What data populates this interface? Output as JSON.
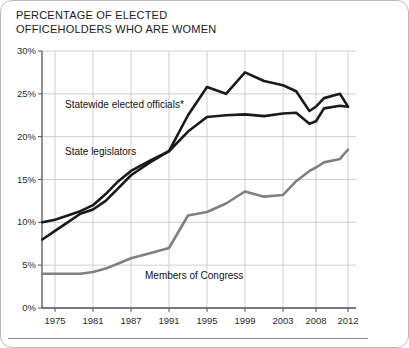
{
  "title": {
    "line1": "PERCENTAGE OF ELECTED",
    "line2": "OFFICEHOLDERS WHO ARE WOMEN",
    "full": "PERCENTAGE OF ELECTED OFFICEHOLDERS WHO ARE WOMEN"
  },
  "colors": {
    "dark_line": "#1a1a1a",
    "gray_line": "#808080",
    "gridline": "#cfcfcf",
    "axis": "#555555",
    "text": "#1b1b1b",
    "frame": "#b9b9b9",
    "background": "#ffffff"
  },
  "annotations": [
    {
      "name": "statewide-elected-officials",
      "label": "Statewide elected officials*"
    },
    {
      "name": "state-legislators",
      "label": "State legislators"
    },
    {
      "name": "members-of-congress",
      "label": "Members of Congress"
    }
  ],
  "chart_data": {
    "type": "line",
    "title": "PERCENTAGE OF ELECTED OFFICEHOLDERS WHO ARE WOMEN",
    "xlabel": "",
    "ylabel": "",
    "ylim": [
      0,
      30
    ],
    "yticks": [
      0,
      5,
      10,
      15,
      20,
      25,
      30
    ],
    "ytick_labels": [
      "0%",
      "5%",
      "10%",
      "15%",
      "20%",
      "25%",
      "30%"
    ],
    "xticks": [
      1975,
      1981,
      1987,
      1991,
      1995,
      1999,
      2003,
      2008,
      2012
    ],
    "xtick_labels": [
      "1975",
      "1981",
      "1987",
      "1991",
      "1995",
      "1999",
      "2003",
      "2008",
      "2012"
    ],
    "xlim": [
      1973,
      2013
    ],
    "grid": true,
    "legend": "inline-annotations",
    "series": [
      {
        "name": "Statewide elected officials*",
        "color": "#1a1a1a",
        "x": [
          1973,
          1975,
          1977,
          1979,
          1981,
          1983,
          1985,
          1987,
          1989,
          1991,
          1993,
          1995,
          1997,
          1999,
          2001,
          2003,
          2005,
          2007,
          2008,
          2009,
          2011,
          2012
        ],
        "values": [
          8.0,
          9.0,
          10.0,
          11.0,
          11.5,
          12.5,
          14.0,
          15.5,
          17.0,
          18.3,
          22.5,
          25.8,
          25.0,
          27.5,
          26.5,
          26.0,
          25.3,
          23.0,
          23.5,
          24.5,
          25.0,
          23.5
        ]
      },
      {
        "name": "State legislators",
        "color": "#1a1a1a",
        "x": [
          1973,
          1975,
          1977,
          1979,
          1981,
          1983,
          1985,
          1987,
          1989,
          1991,
          1993,
          1995,
          1997,
          1999,
          2001,
          2003,
          2005,
          2007,
          2008,
          2009,
          2011,
          2012
        ],
        "values": [
          10.0,
          10.3,
          10.8,
          11.3,
          12.0,
          13.3,
          14.8,
          16.0,
          17.2,
          18.3,
          20.6,
          22.3,
          22.5,
          22.6,
          22.4,
          22.7,
          22.8,
          21.5,
          21.8,
          23.3,
          23.6,
          23.5
        ]
      },
      {
        "name": "Members of Congress",
        "color": "#808080",
        "x": [
          1973,
          1975,
          1977,
          1979,
          1981,
          1983,
          1985,
          1987,
          1989,
          1991,
          1993,
          1995,
          1997,
          1999,
          2001,
          2003,
          2005,
          2007,
          2008,
          2009,
          2011,
          2012
        ],
        "values": [
          4.0,
          4.0,
          4.0,
          4.0,
          4.2,
          4.6,
          5.2,
          5.8,
          6.4,
          7.0,
          10.8,
          11.2,
          12.2,
          13.6,
          13.0,
          13.2,
          14.8,
          16.0,
          16.4,
          17.0,
          17.4,
          18.5
        ]
      }
    ]
  }
}
